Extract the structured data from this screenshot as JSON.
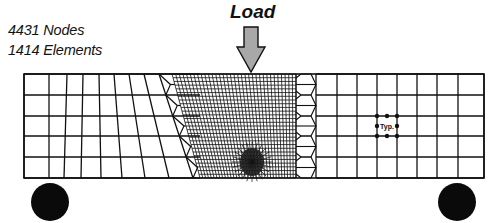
{
  "figure": {
    "stats": {
      "nodes": "4431 Nodes",
      "elements": "1414 Elements"
    },
    "load_label": "Load",
    "typical_element_label": "Typ.",
    "colors": {
      "line": "#111111",
      "arrow_fill": "#a8a8a8",
      "support_fill": "#0a0a0a",
      "background": "#ffffff"
    },
    "beam": {
      "x0": 24,
      "x1": 484,
      "y0": 74,
      "y1": 178
    },
    "rows_y": [
      74,
      95,
      116,
      136,
      157,
      178
    ],
    "left_zone": {
      "top_x": [
        24,
        49,
        67,
        83,
        99,
        114,
        129,
        144,
        159
      ],
      "bottom_x": [
        24,
        49,
        64,
        81,
        101,
        122,
        145,
        169,
        193
      ]
    },
    "right_zone": {
      "x": [
        316,
        337,
        357,
        377,
        397,
        417,
        437,
        458,
        484
      ]
    },
    "dense_zone": {
      "top_left": 172,
      "top_right": 296,
      "bottom_left": 200,
      "bottom_right": 296,
      "vertical_count": 34,
      "horizontal_count": 28
    },
    "crack_tip": {
      "cx": 252,
      "cy": 162,
      "r": 12
    },
    "load_arrow": {
      "x": 251,
      "shaft_top": 27,
      "shaft_bottom": 47,
      "shaft_half_width": 7,
      "head_half_width": 14,
      "tip_y": 72
    },
    "typ_element": {
      "x": 377,
      "y": 116,
      "w": 20,
      "h": 20
    },
    "supports": [
      {
        "name": "left-support",
        "cx": 50,
        "cy": 202,
        "r": 19
      },
      {
        "name": "right-support",
        "cx": 457,
        "cy": 202,
        "r": 19
      }
    ]
  }
}
